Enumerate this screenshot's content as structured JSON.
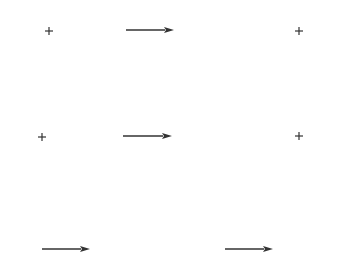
{
  "canvas": {
    "width": 351,
    "height": 274,
    "background": "#ffffff"
  },
  "style": {
    "stroke_color": "#333333",
    "plus_arm": 4,
    "plus_stroke": 1.2,
    "arrow_stroke": 1.4,
    "arrow_head_len": 10,
    "arrow_head_half": 3
  },
  "plus_markers": [
    {
      "id": "plus-1",
      "x": 49,
      "y": 31
    },
    {
      "id": "plus-2",
      "x": 299,
      "y": 31
    },
    {
      "id": "plus-3",
      "x": 42,
      "y": 137
    },
    {
      "id": "plus-4",
      "x": 299,
      "y": 136
    }
  ],
  "arrows": [
    {
      "id": "arrow-1",
      "x1": 126,
      "y1": 30,
      "x2": 174,
      "y2": 30,
      "direction": "right"
    },
    {
      "id": "arrow-2",
      "x1": 123,
      "y1": 136,
      "x2": 172,
      "y2": 136,
      "direction": "right"
    },
    {
      "id": "arrow-3",
      "x1": 42,
      "y1": 249,
      "x2": 90,
      "y2": 249,
      "direction": "right"
    },
    {
      "id": "arrow-4",
      "x1": 225,
      "y1": 249,
      "x2": 273,
      "y2": 249,
      "direction": "right"
    }
  ]
}
